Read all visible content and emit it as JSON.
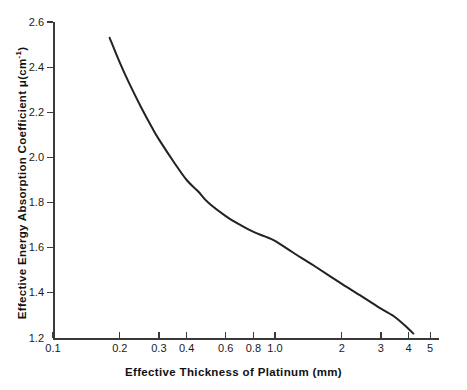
{
  "chart_data": {
    "type": "line",
    "title": "",
    "xlabel": "Effective Thickness of Platinum (mm)",
    "ylabel": "Effective Energy Absorption Coefficient μ(cm⁻¹)",
    "ylabel_text": "Effective Energy Absorption Coefficient ",
    "ylabel_symbol": "μ(cm",
    "ylabel_exponent": "-1",
    "ylabel_close": ")",
    "xscale": "log",
    "yscale": "linear",
    "xlim": [
      0.1,
      5.5
    ],
    "ylim": [
      1.2,
      2.6
    ],
    "grid": false,
    "legend": false,
    "xticks": [
      0.1,
      0.2,
      0.3,
      0.4,
      0.6,
      0.8,
      1.0,
      2,
      3,
      4,
      5
    ],
    "xtick_labels": [
      "0.1",
      "0.2",
      "0.3",
      "0.4",
      "0.6",
      "0.8",
      "1.0",
      "2",
      "3",
      "4",
      "5"
    ],
    "yticks": [
      1.2,
      1.4,
      1.6,
      1.8,
      2.0,
      2.2,
      2.4,
      2.6
    ],
    "ytick_labels": [
      "1.2",
      "1.4",
      "1.6",
      "1.8",
      "2.0",
      "2.2",
      "2.4",
      "2.6"
    ],
    "series": [
      {
        "name": "Effective energy absorption coefficient of platinum",
        "color": "#222222",
        "line_width": 2,
        "x": [
          0.18,
          0.2,
          0.22,
          0.25,
          0.28,
          0.3,
          0.35,
          0.4,
          0.45,
          0.5,
          0.6,
          0.7,
          0.8,
          0.9,
          1.0,
          1.2,
          1.5,
          2.0,
          2.5,
          3.0,
          3.5,
          4.0,
          4.2
        ],
        "y": [
          2.53,
          2.42,
          2.33,
          2.22,
          2.13,
          2.08,
          1.98,
          1.9,
          1.85,
          1.8,
          1.74,
          1.7,
          1.67,
          1.65,
          1.63,
          1.58,
          1.52,
          1.44,
          1.38,
          1.33,
          1.29,
          1.24,
          1.22
        ]
      }
    ]
  },
  "axes": {
    "x_title": "Effective Thickness of Platinum (mm)",
    "y_title_main": "Effective Energy Absorption Coefficient ",
    "y_title_mu": "μ(cm",
    "y_title_sup": "-1",
    "y_title_tail": ")"
  },
  "colors": {
    "curve": "#222222",
    "axis": "#3a3a3a",
    "background": "#ffffff",
    "text": "#1a1a1a"
  }
}
